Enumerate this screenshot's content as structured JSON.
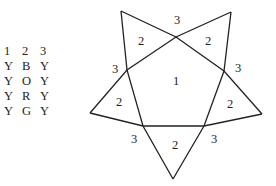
{
  "legend": {
    "header": [
      "1",
      "2",
      "3"
    ],
    "rows": [
      [
        "Y",
        "B",
        "Y"
      ],
      [
        "Y",
        "O",
        "Y"
      ],
      [
        "Y",
        "R",
        "Y"
      ],
      [
        "Y",
        "G",
        "Y"
      ]
    ]
  },
  "star": {
    "stroke_color": "#222222",
    "labels": {
      "center": "1",
      "top": "3",
      "top_left_point": "2",
      "top_right_point": "2",
      "left_mid": "3",
      "right_mid": "3",
      "left_point": "2",
      "right_point": "2",
      "bottom_left": "3",
      "bottom_point": "2",
      "bottom_right": "3"
    }
  }
}
